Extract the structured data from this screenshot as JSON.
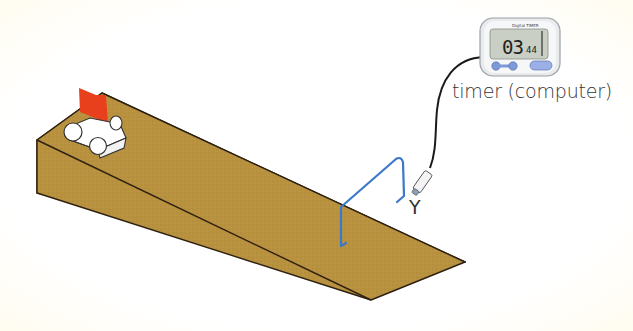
{
  "diagram": {
    "labels": {
      "timer": "timer (computer)",
      "gate": "Y"
    },
    "timer_display": {
      "brand": "Digital TIMER",
      "main_digits": "03",
      "small_digits": "44"
    },
    "colors": {
      "ramp_fill": "#b8923f",
      "ramp_edge": "#3a2a14",
      "flag": "#e8401c",
      "gate_wire": "#3a78c8",
      "cable": "#1a1a1a",
      "timer_body": "#e8eaec",
      "timer_screen": "#c9cfc4",
      "timer_buttons": "#7f9ad8"
    }
  }
}
